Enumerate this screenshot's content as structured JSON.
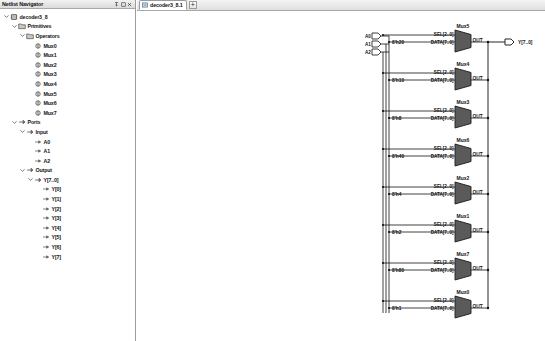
{
  "left_dock": {
    "title": "Netlist Navigator",
    "buttons": [
      {
        "name": "auto-hide-pin-button",
        "glyph": "pin"
      },
      {
        "name": "float-button",
        "glyph": "float"
      },
      {
        "name": "close-panel-button",
        "glyph": "close"
      }
    ],
    "tree": [
      {
        "label": "decoder3_8",
        "depth": 0,
        "icon": "chip-icon",
        "expanded": true
      },
      {
        "label": "Primitives",
        "depth": 1,
        "icon": "folder-icon",
        "expanded": true
      },
      {
        "label": "Operators",
        "depth": 2,
        "icon": "folder-icon",
        "expanded": true
      },
      {
        "label": "Mux0",
        "depth": 3,
        "icon": "instance-icon",
        "expanded": null
      },
      {
        "label": "Mux1",
        "depth": 3,
        "icon": "instance-icon",
        "expanded": null
      },
      {
        "label": "Mux2",
        "depth": 3,
        "icon": "instance-icon",
        "expanded": null
      },
      {
        "label": "Mux3",
        "depth": 3,
        "icon": "instance-icon",
        "expanded": null
      },
      {
        "label": "Mux4",
        "depth": 3,
        "icon": "instance-icon",
        "expanded": null
      },
      {
        "label": "Mux5",
        "depth": 3,
        "icon": "instance-icon",
        "expanded": null
      },
      {
        "label": "Mux6",
        "depth": 3,
        "icon": "instance-icon",
        "expanded": null
      },
      {
        "label": "Mux7",
        "depth": 3,
        "icon": "instance-icon",
        "expanded": null
      },
      {
        "label": "Ports",
        "depth": 1,
        "icon": "port-icon",
        "expanded": true
      },
      {
        "label": "Input",
        "depth": 2,
        "icon": "port-icon",
        "expanded": true
      },
      {
        "label": "A0",
        "depth": 3,
        "icon": "pin-icon",
        "expanded": null
      },
      {
        "label": "A1",
        "depth": 3,
        "icon": "pin-icon",
        "expanded": null
      },
      {
        "label": "A2",
        "depth": 3,
        "icon": "pin-icon",
        "expanded": null
      },
      {
        "label": "Output",
        "depth": 2,
        "icon": "port-icon",
        "expanded": true
      },
      {
        "label": "Y[7..0]",
        "depth": 3,
        "icon": "port-icon",
        "expanded": true
      },
      {
        "label": "Y[0]",
        "depth": 4,
        "icon": "pin-icon",
        "expanded": null
      },
      {
        "label": "Y[1]",
        "depth": 4,
        "icon": "pin-icon",
        "expanded": null
      },
      {
        "label": "Y[2]",
        "depth": 4,
        "icon": "pin-icon",
        "expanded": null
      },
      {
        "label": "Y[3]",
        "depth": 4,
        "icon": "pin-icon",
        "expanded": null
      },
      {
        "label": "Y[4]",
        "depth": 4,
        "icon": "pin-icon",
        "expanded": null
      },
      {
        "label": "Y[5]",
        "depth": 4,
        "icon": "pin-icon",
        "expanded": null
      },
      {
        "label": "Y[6]",
        "depth": 4,
        "icon": "pin-icon",
        "expanded": null
      },
      {
        "label": "Y[7]",
        "depth": 4,
        "icon": "pin-icon",
        "expanded": null
      }
    ]
  },
  "doc_area": {
    "tab": {
      "label": "decoder3_8.1",
      "icon": "schematic-icon"
    },
    "add_tab_label": "+"
  },
  "schematic": {
    "inputs": [
      {
        "label": "A0",
        "y": 36
      },
      {
        "label": "A1",
        "y": 44
      },
      {
        "label": "A2",
        "y": 52
      }
    ],
    "output": {
      "label": "Y[7..0]",
      "y": 41
    },
    "mux_pin_sel": "SEL[2..0]",
    "mux_pin_data": "DATA[7..0]",
    "mux_pin_out": "OUT",
    "muxes": [
      {
        "name": "Mux5",
        "constant": "8'h20",
        "y": 41
      },
      {
        "name": "Mux4",
        "constant": "8'h10",
        "y": 79
      },
      {
        "name": "Mux3",
        "constant": "8'h8",
        "y": 117
      },
      {
        "name": "Mux6",
        "constant": "8'h40",
        "y": 155
      },
      {
        "name": "Mux2",
        "constant": "8'h4",
        "y": 193
      },
      {
        "name": "Mux1",
        "constant": "8'h2",
        "y": 231
      },
      {
        "name": "Mux7",
        "constant": "8'h80",
        "y": 269
      },
      {
        "name": "Mux0",
        "constant": "8'h1",
        "y": 307
      }
    ]
  },
  "colors": {
    "mux_fill": "#5a5a5a",
    "wire": "#111111",
    "panel_border": "#9d9d9d",
    "tab_gradient_top": "#f4f4f4"
  }
}
